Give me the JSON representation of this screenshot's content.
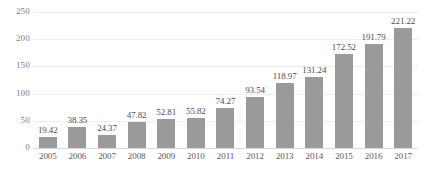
{
  "chart_data": {
    "type": "bar",
    "title": "",
    "xlabel": "",
    "ylabel": "",
    "categories": [
      "2005",
      "2006",
      "2007",
      "2008",
      "2009",
      "2010",
      "2011",
      "2012",
      "2013",
      "2014",
      "2015",
      "2016",
      "2017"
    ],
    "values": [
      19.42,
      38.35,
      24.37,
      47.82,
      52.81,
      55.82,
      74.27,
      93.54,
      118.97,
      131.24,
      172.52,
      191.79,
      221.22
    ],
    "value_labels": [
      "19.42",
      "38.35",
      "24.37",
      "47.82",
      "52.81",
      "55.82",
      "74.27",
      "93.54",
      "118.97",
      "131.24",
      "172.52",
      "191.79",
      "221.22"
    ],
    "ylim": [
      0,
      250
    ],
    "yticks": [
      0,
      50,
      100,
      150,
      200,
      250
    ],
    "ytick_labels": [
      "0",
      "50",
      "100",
      "150",
      "200",
      "250"
    ],
    "grid": true,
    "legend": false,
    "bar_color": "#9a9a9a",
    "gridline_color": "#ededed",
    "axis_color": "#d9d9d9",
    "label_color": "#4d4d4d",
    "tick_color": "#808080"
  }
}
